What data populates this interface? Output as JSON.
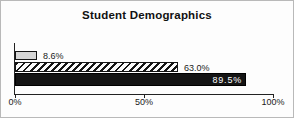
{
  "chart": {
    "title": "Student Demographics",
    "bars": [
      {
        "label": "8.6%",
        "value": 8.6,
        "style": "gray",
        "label_position": "outside"
      },
      {
        "label": "63.0%",
        "value": 63.0,
        "style": "hatched",
        "label_position": "outside"
      },
      {
        "label": "89.5%",
        "value": 89.5,
        "style": "black",
        "label_position": "inside"
      }
    ],
    "x_axis": {
      "min": 0,
      "max": 100,
      "ticks": [
        {
          "label": "0%",
          "value": 0
        },
        {
          "label": "50%",
          "value": 50
        },
        {
          "label": "100%",
          "value": 100
        }
      ]
    },
    "colors": {
      "bar_gray_fill": "#d6d6d6",
      "bar_hatch_foreground": "#141414",
      "bar_hatch_background": "#fafafa",
      "bar_black_fill": "#141414",
      "inside_label_text": "#ffffff",
      "axis": "#222222",
      "frame_border": "#b9b9b9"
    }
  },
  "chart_data": {
    "type": "bar",
    "orientation": "horizontal",
    "title": "Student Demographics",
    "categories": [
      "",
      "",
      ""
    ],
    "values": [
      8.6,
      63.0,
      89.5
    ],
    "data_labels": [
      "8.6%",
      "63.0%",
      "89.5%"
    ],
    "xlim": [
      0,
      100
    ],
    "x_tick_labels": [
      "0%",
      "50%",
      "100%"
    ],
    "xlabel": "",
    "ylabel": "",
    "grid": false,
    "legend": false,
    "bar_styles": [
      "light-gray-solid",
      "white-with-black-diagonal-hatch",
      "solid-black-with-white-inside-label"
    ]
  }
}
